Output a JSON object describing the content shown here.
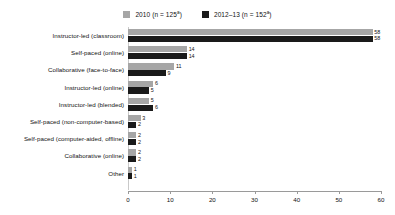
{
  "chart_data": {
    "type": "bar",
    "orientation": "horizontal",
    "title": "",
    "xlabel": "",
    "ylabel": "",
    "xlim": [
      0,
      60
    ],
    "xticks": [
      0,
      10,
      20,
      30,
      40,
      50,
      60
    ],
    "grid": false,
    "legend_position": "top-center",
    "categories": [
      "Instructor-led (classroom)",
      "Self-paced (online)",
      "Collaborative (face-to-face)",
      "Instructor-led (online)",
      "Instructor-led (blended)",
      "Self-paced (non-computer-based)",
      "Self-paced (computer-aided, offline)",
      "Collaborative (online)",
      "Other"
    ],
    "series": [
      {
        "name": "2010 (n = 125)",
        "legend_label": "2010 (n = 125",
        "legend_superscript": "a",
        "color": "#a6a6a6",
        "values": [
          58,
          14,
          11,
          6,
          5,
          3,
          2,
          2,
          1
        ]
      },
      {
        "name": "2012–13 (n = 152)",
        "legend_label": "2012–13 (n = 152",
        "legend_superscript": "a",
        "color": "#1a1a1a",
        "values": [
          58,
          14,
          9,
          5,
          6,
          2,
          2,
          2,
          1
        ]
      }
    ]
  }
}
